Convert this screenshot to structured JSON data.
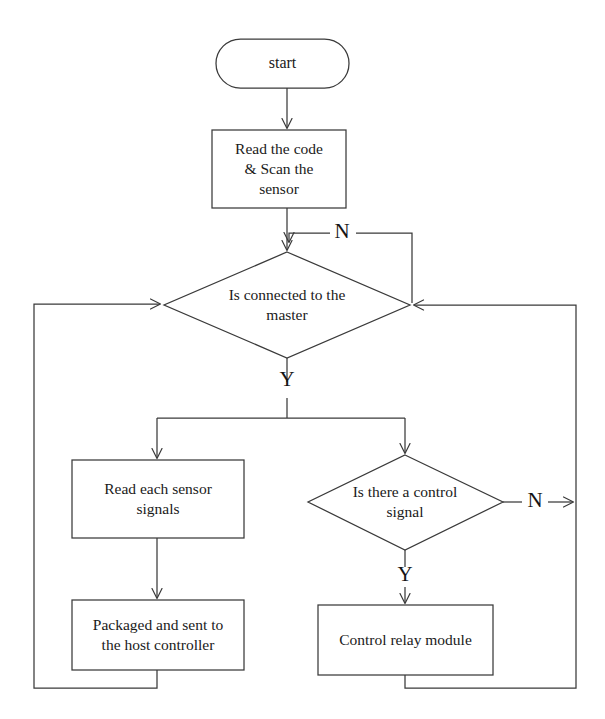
{
  "diagram": {
    "type": "flowchart",
    "background_color": "#ffffff",
    "stroke_color": "#3a3a3a",
    "text_color": "#1a1a1a",
    "nodes": [
      {
        "id": "start",
        "shape": "terminator",
        "label": "start"
      },
      {
        "id": "read_scan",
        "shape": "process",
        "label": "Read the code\n& Scan the\nsensor"
      },
      {
        "id": "is_connected",
        "shape": "decision",
        "label": "Is connected to the\nmaster"
      },
      {
        "id": "read_signals",
        "shape": "process",
        "label": "Read each sensor\nsignals"
      },
      {
        "id": "packaged",
        "shape": "process",
        "label": "Packaged and sent to\nthe host controller"
      },
      {
        "id": "is_control",
        "shape": "decision",
        "label": "Is there a control\nsignal"
      },
      {
        "id": "relay",
        "shape": "process",
        "label": "Control relay module"
      }
    ],
    "edge_labels": [
      {
        "id": "connected_no",
        "label": "N"
      },
      {
        "id": "connected_yes",
        "label": "Y"
      },
      {
        "id": "control_no",
        "label": "N"
      },
      {
        "id": "control_yes",
        "label": "Y"
      }
    ]
  }
}
